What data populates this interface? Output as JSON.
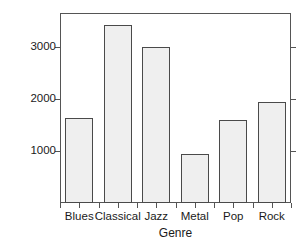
{
  "chart_data": {
    "type": "bar",
    "title": "",
    "xlabel": "Genre",
    "ylabel": "Frequency",
    "categories": [
      "Blues",
      "Classical",
      "Jazz",
      "Metal",
      "Pop",
      "Rock"
    ],
    "values": [
      1630,
      3420,
      3000,
      940,
      1590,
      1950
    ],
    "ytick_labels": [
      "1000",
      "2000",
      "3000"
    ],
    "ytick_values": [
      1000,
      2000,
      3000
    ],
    "ylim": [
      0,
      3650
    ],
    "grid": false,
    "legend": false,
    "legend_position": "none",
    "bar_fill_color": "#efefef",
    "bar_border_color": "#4a4a4a",
    "axis_color": "#555555",
    "background_color": "#ffffff"
  }
}
